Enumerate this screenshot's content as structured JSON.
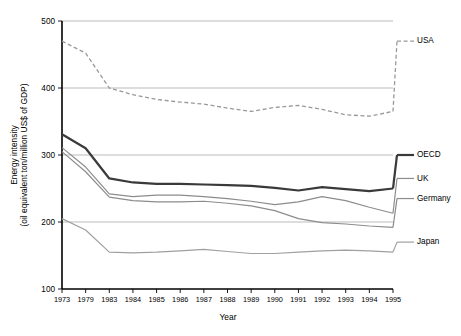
{
  "chart_data": {
    "type": "line",
    "title": "",
    "xlabel": "Year",
    "ylabel": "Energy intensity\n(oil equivalent ton/million US$ of GDP)",
    "ylabel_line1": "Energy intensity",
    "ylabel_line2": "(oil equivalent ton/million US$ of GDP)",
    "categories": [
      "1973",
      "1979",
      "1983",
      "1984",
      "1985",
      "1986",
      "1987",
      "1988",
      "1989",
      "1990",
      "1991",
      "1992",
      "1993",
      "1994",
      "1995"
    ],
    "xlim": [
      0,
      14
    ],
    "ylim": [
      100,
      500
    ],
    "yticks": [
      100,
      200,
      300,
      400,
      500
    ],
    "ytick_labels": [
      "100",
      "200",
      "300",
      "400",
      "500"
    ],
    "grid": true,
    "legend_position": "right",
    "series": [
      {
        "name": "USA",
        "color": "#999999",
        "style": "dashed",
        "width": 1.3,
        "values": [
          470,
          452,
          400,
          390,
          383,
          379,
          376,
          370,
          365,
          371,
          374,
          368,
          360,
          358,
          365
        ],
        "legend_y": 470
      },
      {
        "name": "OECD",
        "color": "#3a3a3a",
        "style": "solid",
        "width": 2.2,
        "values": [
          331,
          310,
          265,
          259,
          257,
          257,
          256,
          255,
          254,
          251,
          247,
          252,
          249,
          246,
          250
        ],
        "legend_y": 300
      },
      {
        "name": "UK",
        "color": "#8c8c8c",
        "style": "solid",
        "width": 1.2,
        "values": [
          311,
          282,
          242,
          238,
          240,
          240,
          238,
          235,
          231,
          226,
          230,
          238,
          232,
          222,
          213
        ],
        "legend_y": 265
      },
      {
        "name": "Germany",
        "color": "#8c8c8c",
        "style": "solid",
        "width": 1.2,
        "values": [
          305,
          275,
          237,
          232,
          230,
          230,
          231,
          228,
          224,
          217,
          205,
          199,
          197,
          194,
          192
        ],
        "legend_y": 235
      },
      {
        "name": "Japan",
        "color": "#a0a0a0",
        "style": "solid",
        "width": 1.2,
        "values": [
          205,
          188,
          155,
          154,
          155,
          157,
          159,
          156,
          153,
          153,
          155,
          157,
          158,
          157,
          155
        ],
        "legend_y": 170
      }
    ]
  }
}
